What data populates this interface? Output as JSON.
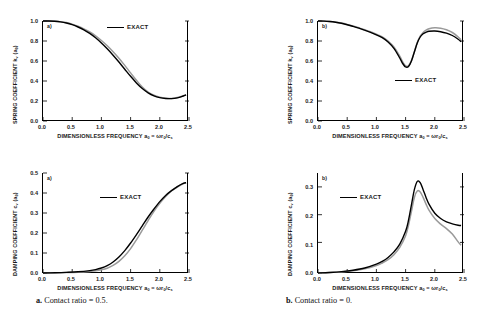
{
  "figure": {
    "captions": [
      {
        "marker": "a.",
        "text": "Contact ratio = 0.5."
      },
      {
        "marker": "b.",
        "text": "Contact ratio = 0."
      }
    ]
  },
  "axis_text": {
    "xlabel_main": "DIMENSIONLESS FREQUENCY",
    "xlabel_expr": "a0 = ωr0/cs",
    "ylabel_spring": "SPRING COEFFICIENT",
    "ylabel_spring_sym": "kv (a0)",
    "ylabel_damping": "DAMPING COEFFICIENT",
    "ylabel_damping_sym": "cv (a0)",
    "legend_label": "EXACT"
  },
  "chart_data": [
    {
      "id": "spring-contact-0p5",
      "type": "line",
      "panel_letter": "a)",
      "title": "",
      "xlabel": "DIMENSIONLESS FREQUENCY a0 = ωr0/cs",
      "ylabel": "SPRING COEFFICIENT kv (a0)",
      "xlim": [
        0.0,
        2.5
      ],
      "ylim": [
        0.0,
        1.0
      ],
      "xticks": [
        "0.0",
        "0.5",
        "1.0",
        "1.5",
        "2.0",
        "2.5"
      ],
      "yticks": [
        "0.0",
        "0.2",
        "0.4",
        "0.6",
        "0.8",
        "1.0"
      ],
      "grid": false,
      "legend": {
        "position": "top-right",
        "entries": [
          "EXACT"
        ]
      },
      "x": [
        0.0,
        0.1,
        0.2,
        0.3,
        0.4,
        0.5,
        0.6,
        0.7,
        0.8,
        0.9,
        1.0,
        1.1,
        1.2,
        1.3,
        1.4,
        1.5,
        1.6,
        1.7,
        1.8,
        1.9,
        2.0,
        2.1,
        2.2,
        2.3,
        2.4,
        2.45
      ],
      "series": [
        {
          "name": "approximate",
          "color": "#000000",
          "values": [
            1.0,
            1.0,
            0.997,
            0.991,
            0.98,
            0.963,
            0.94,
            0.912,
            0.876,
            0.832,
            0.78,
            0.722,
            0.658,
            0.59,
            0.518,
            0.447,
            0.381,
            0.325,
            0.282,
            0.252,
            0.234,
            0.225,
            0.224,
            0.231,
            0.25,
            0.262
          ]
        },
        {
          "name": "EXACT",
          "color": "#9a9a9a",
          "values": [
            1.0,
            1.0,
            0.998,
            0.993,
            0.984,
            0.969,
            0.948,
            0.922,
            0.89,
            0.851,
            0.805,
            0.752,
            0.693,
            0.628,
            0.556,
            0.481,
            0.407,
            0.34,
            0.29,
            0.257,
            0.238,
            0.228,
            0.226,
            0.234,
            0.252,
            0.264
          ]
        }
      ]
    },
    {
      "id": "spring-contact-0",
      "type": "line",
      "panel_letter": "b)",
      "title": "",
      "xlabel": "DIMENSIONLESS FREQUENCY a0 = ωr0/cs",
      "ylabel": "SPRING COEFFICIENT kv (a0)",
      "xlim": [
        0.0,
        2.5
      ],
      "ylim": [
        0.0,
        1.0
      ],
      "xticks": [
        "0.0",
        "0.5",
        "1.0",
        "1.5",
        "2.0",
        "2.5"
      ],
      "yticks": [
        "0.0",
        "0.2",
        "0.4",
        "0.6",
        "0.8",
        "1.0"
      ],
      "grid": false,
      "legend": {
        "position": "mid-right",
        "entries": [
          "EXACT"
        ]
      },
      "x": [
        0.0,
        0.1,
        0.2,
        0.3,
        0.4,
        0.5,
        0.6,
        0.7,
        0.8,
        0.9,
        1.0,
        1.1,
        1.2,
        1.3,
        1.4,
        1.45,
        1.5,
        1.55,
        1.6,
        1.65,
        1.7,
        1.75,
        1.8,
        1.85,
        1.9,
        2.0,
        2.1,
        2.2,
        2.3,
        2.4,
        2.45
      ],
      "series": [
        {
          "name": "approximate",
          "color": "#000000",
          "values": [
            1.0,
            0.999,
            0.995,
            0.988,
            0.977,
            0.963,
            0.946,
            0.928,
            0.908,
            0.887,
            0.862,
            0.833,
            0.79,
            0.726,
            0.63,
            0.575,
            0.54,
            0.545,
            0.6,
            0.69,
            0.78,
            0.84,
            0.872,
            0.888,
            0.897,
            0.9,
            0.893,
            0.878,
            0.855,
            0.818,
            0.792
          ]
        },
        {
          "name": "EXACT",
          "color": "#9a9a9a",
          "values": [
            1.0,
            0.999,
            0.996,
            0.989,
            0.979,
            0.966,
            0.95,
            0.932,
            0.913,
            0.893,
            0.869,
            0.841,
            0.8,
            0.74,
            0.648,
            0.592,
            0.552,
            0.552,
            0.604,
            0.692,
            0.784,
            0.848,
            0.886,
            0.908,
            0.922,
            0.932,
            0.928,
            0.912,
            0.885,
            0.84,
            0.812
          ]
        }
      ]
    },
    {
      "id": "damping-contact-0p5",
      "type": "line",
      "panel_letter": "a)",
      "title": "",
      "xlabel": "DIMENSIONLESS FREQUENCY a0 = ωr0/cs",
      "ylabel": "DAMPING COEFFICIENT cv (a0)",
      "xlim": [
        0.0,
        2.5
      ],
      "ylim": [
        0.0,
        0.5
      ],
      "xticks": [
        "0.0",
        "0.5",
        "1.0",
        "1.5",
        "2.0",
        "2.5"
      ],
      "yticks": [
        "0.0",
        "0.1",
        "0.2",
        "0.3",
        "0.4",
        "0.5"
      ],
      "grid": false,
      "legend": {
        "position": "upper-center",
        "entries": [
          "EXACT"
        ]
      },
      "x": [
        0.0,
        0.2,
        0.4,
        0.6,
        0.8,
        0.9,
        1.0,
        1.1,
        1.2,
        1.3,
        1.4,
        1.5,
        1.6,
        1.7,
        1.8,
        1.9,
        2.0,
        2.1,
        2.2,
        2.3,
        2.4,
        2.45
      ],
      "series": [
        {
          "name": "approximate",
          "color": "#000000",
          "values": [
            0.0,
            0.001,
            0.003,
            0.006,
            0.012,
            0.017,
            0.025,
            0.037,
            0.055,
            0.08,
            0.112,
            0.15,
            0.192,
            0.236,
            0.28,
            0.32,
            0.357,
            0.388,
            0.412,
            0.432,
            0.448,
            0.452
          ]
        },
        {
          "name": "EXACT",
          "color": "#9a9a9a",
          "values": [
            0.0,
            0.001,
            0.002,
            0.004,
            0.008,
            0.011,
            0.016,
            0.024,
            0.038,
            0.058,
            0.086,
            0.122,
            0.166,
            0.214,
            0.262,
            0.308,
            0.348,
            0.382,
            0.41,
            0.43,
            0.446,
            0.451
          ]
        }
      ]
    },
    {
      "id": "damping-contact-0",
      "type": "line",
      "panel_letter": "b)",
      "title": "",
      "xlabel": "DIMENSIONLESS FREQUENCY a0 = ωr0/cs",
      "ylabel": "DAMPING COEFFICIENT cv (a0)",
      "xlim": [
        0.0,
        2.5
      ],
      "ylim": [
        0.0,
        0.36
      ],
      "xticks": [
        "0.0",
        "0.5",
        "1.0",
        "1.5",
        "2.0",
        "2.5"
      ],
      "yticks": [
        "0.0",
        "0.1",
        "0.2",
        "0.3"
      ],
      "grid": false,
      "legend": {
        "position": "upper-left",
        "entries": [
          "EXACT"
        ]
      },
      "x": [
        0.0,
        0.2,
        0.4,
        0.6,
        0.8,
        1.0,
        1.1,
        1.2,
        1.3,
        1.4,
        1.5,
        1.55,
        1.6,
        1.65,
        1.7,
        1.75,
        1.8,
        1.85,
        1.9,
        2.0,
        2.1,
        2.2,
        2.3,
        2.4,
        2.45
      ],
      "series": [
        {
          "name": "approximate",
          "color": "#000000",
          "values": [
            0.0,
            0.002,
            0.005,
            0.01,
            0.018,
            0.032,
            0.042,
            0.056,
            0.076,
            0.104,
            0.15,
            0.19,
            0.245,
            0.3,
            0.33,
            0.325,
            0.3,
            0.272,
            0.248,
            0.215,
            0.196,
            0.184,
            0.177,
            0.172,
            0.171
          ]
        },
        {
          "name": "EXACT",
          "color": "#9a9a9a",
          "values": [
            0.0,
            0.002,
            0.004,
            0.008,
            0.015,
            0.027,
            0.036,
            0.048,
            0.066,
            0.092,
            0.134,
            0.172,
            0.222,
            0.272,
            0.295,
            0.292,
            0.272,
            0.248,
            0.226,
            0.196,
            0.176,
            0.16,
            0.14,
            0.112,
            0.1
          ]
        }
      ]
    }
  ]
}
